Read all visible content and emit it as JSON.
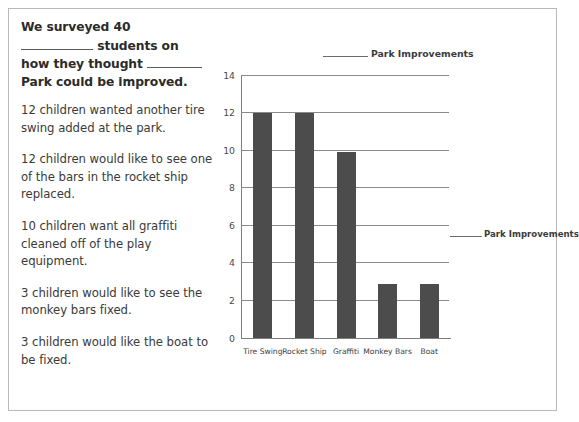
{
  "worksheet": {
    "prompt": {
      "line1": "We surveyed 40",
      "line2_after_blank": " students on",
      "line3_before_blank": "how they thought ",
      "line4": "Park could be improved."
    },
    "facts": [
      "12 children wanted another tire swing added at the park.",
      "12 children would like to see one of the bars in the rocket ship replaced.",
      "10 children want all graffiti cleaned off of the play equipment.",
      "3 children would like to see the monkey bars fixed.",
      "3 children would like the boat to be fixed."
    ]
  },
  "chart_labels": {
    "title_text": "Park Improvements",
    "side_label_text": "Park Improvements"
  },
  "chart_data": {
    "type": "bar",
    "categories": [
      "Tire Swing",
      "Rocket Ship",
      "Graffiti",
      "Monkey Bars",
      "Boat"
    ],
    "values": [
      12,
      12,
      9.9,
      2.9,
      2.9
    ],
    "xlabel": "",
    "ylabel": "",
    "ylim": [
      0,
      14
    ],
    "yticks": [
      0,
      2,
      4,
      6,
      8,
      10,
      12,
      14
    ],
    "grid": true,
    "legend": false,
    "bar_color": "#4c4c4c",
    "axis_color": "#7d7d7d"
  }
}
